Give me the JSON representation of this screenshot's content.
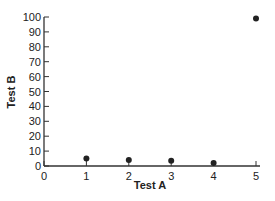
{
  "chart_data": {
    "type": "scatter",
    "title": "",
    "xlabel": "Test A",
    "ylabel": "Test B",
    "xlim": [
      0,
      5
    ],
    "ylim": [
      0,
      100
    ],
    "x_ticks": [
      "0",
      "1",
      "2",
      "3",
      "4",
      "5"
    ],
    "y_ticks": [
      "0",
      "10",
      "20",
      "30",
      "40",
      "50",
      "60",
      "70",
      "80",
      "90",
      "100"
    ],
    "grid": false,
    "legend": null,
    "points": [
      {
        "x": 1,
        "y": 5
      },
      {
        "x": 2,
        "y": 4
      },
      {
        "x": 3,
        "y": 3.5
      },
      {
        "x": 4,
        "y": 2
      },
      {
        "x": 5,
        "y": 99
      }
    ],
    "colors": {
      "points": "#222222",
      "axis": "#333333"
    }
  }
}
